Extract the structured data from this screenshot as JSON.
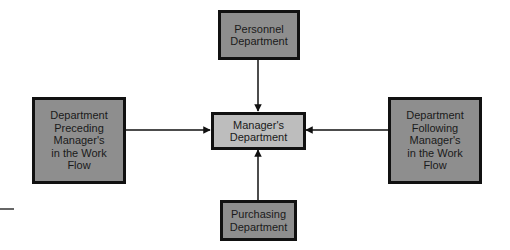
{
  "diagram": {
    "type": "organizational-relationships",
    "nodes": {
      "top": {
        "id": "personnel",
        "label": "Personnel\nDepartment"
      },
      "left": {
        "id": "preceding",
        "label": "Department\nPreceding\nManager's\nin the Work\nFlow"
      },
      "center": {
        "id": "manager",
        "label": "Manager's\nDepartment"
      },
      "right": {
        "id": "following",
        "label": "Department\nFollowing\nManager's\nin the Work\nFlow"
      },
      "bottom": {
        "id": "purchasing",
        "label": "Purchasing\nDepartment"
      }
    },
    "edges": [
      {
        "from": "personnel",
        "to": "manager",
        "direction": "down"
      },
      {
        "from": "preceding",
        "to": "manager",
        "direction": "right"
      },
      {
        "from": "following",
        "to": "manager",
        "direction": "left"
      },
      {
        "from": "purchasing",
        "to": "manager",
        "direction": "up"
      }
    ],
    "colors": {
      "outer_box_fill": "#8e8e8e",
      "center_box_fill": "#bdbdbd",
      "border": "#111111",
      "line": "#111111"
    }
  }
}
